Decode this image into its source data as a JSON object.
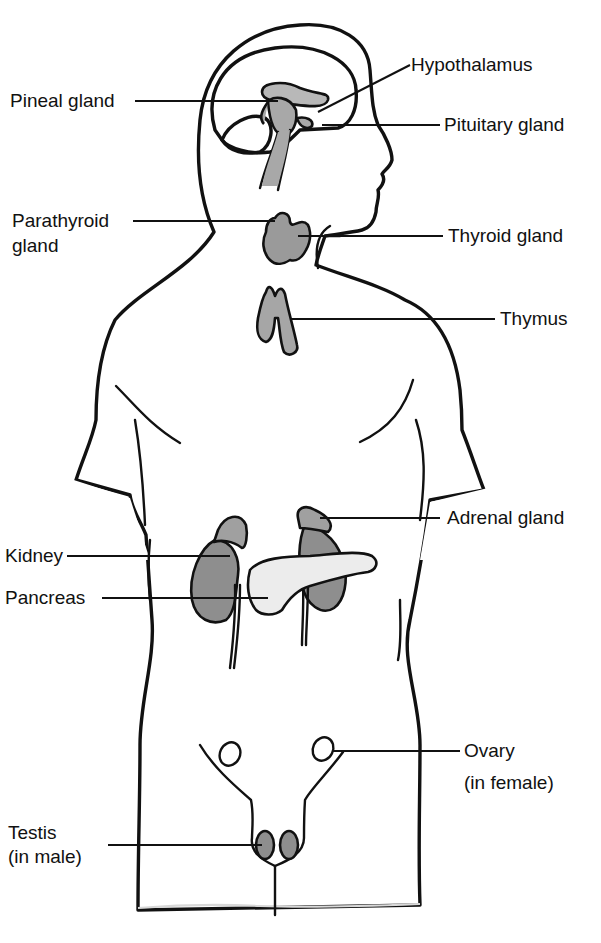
{
  "diagram": {
    "colors": {
      "background": "#ffffff",
      "body_fill": "#c4c4c4",
      "brain_fill": "#e4e4e4",
      "gland_fill": "#9a9a9a",
      "kidney_fill": "#8e8e8e",
      "pancreas_fill": "#ececec",
      "outline": "#111111"
    },
    "labels": {
      "hypothalamus": "Hypothalamus",
      "pineal_gland": "Pineal gland",
      "pituitary_gland": "Pituitary gland",
      "parathyroid_gland_line1": "Parathyroid",
      "parathyroid_gland_line2": "gland",
      "thyroid_gland": "Thyroid gland",
      "thymus": "Thymus",
      "adrenal_gland": "Adrenal gland",
      "kidney": "Kidney",
      "pancreas": "Pancreas",
      "ovary_line1": "Ovary",
      "ovary_line2": "(in female)",
      "testis_line1": "Testis",
      "testis_line2": "(in male)"
    }
  }
}
